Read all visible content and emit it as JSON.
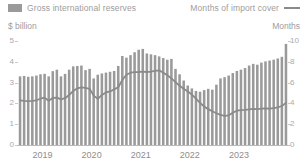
{
  "legend": {
    "bars": {
      "label": "Gross international reserves",
      "icon": "bar-swatch",
      "color": "#9a9a9a"
    },
    "line": {
      "label": "Months of import cover",
      "icon": "line-swatch",
      "color": "#8a8a8a"
    }
  },
  "axes": {
    "left_title": "$ billion",
    "right_title": "Months",
    "left_ticks": [
      "5",
      "4",
      "3",
      "2",
      "1",
      "0"
    ],
    "right_ticks": [
      "10",
      "8",
      "6",
      "4",
      "2",
      "0"
    ]
  },
  "chart_data": {
    "type": "bar",
    "title": "",
    "subtitle": "",
    "xlabel": "",
    "ylabel": "$ billion",
    "y2label": "Months",
    "ylim": [
      0,
      5
    ],
    "y2lim": [
      0,
      10
    ],
    "grid": false,
    "legend_position": "top",
    "x_tick_labels": [
      "2019",
      "2020",
      "2021",
      "2022",
      "2023"
    ],
    "x_tick_index": [
      0,
      12,
      24,
      36,
      48
    ],
    "categories": [
      "2019-01",
      "2019-02",
      "2019-03",
      "2019-04",
      "2019-05",
      "2019-06",
      "2019-07",
      "2019-08",
      "2019-09",
      "2019-10",
      "2019-11",
      "2019-12",
      "2020-01",
      "2020-02",
      "2020-03",
      "2020-04",
      "2020-05",
      "2020-06",
      "2020-07",
      "2020-08",
      "2020-09",
      "2020-10",
      "2020-11",
      "2020-12",
      "2021-01",
      "2021-02",
      "2021-03",
      "2021-04",
      "2021-05",
      "2021-06",
      "2021-07",
      "2021-08",
      "2021-09",
      "2021-10",
      "2021-11",
      "2021-12",
      "2022-01",
      "2022-02",
      "2022-03",
      "2022-04",
      "2022-05",
      "2022-06",
      "2022-07",
      "2022-08",
      "2022-09",
      "2022-10",
      "2022-11",
      "2022-12",
      "2023-01",
      "2023-02",
      "2023-03",
      "2023-04",
      "2023-05",
      "2023-06",
      "2023-07",
      "2023-08",
      "2023-09",
      "2023-10",
      "2023-11",
      "2023-12",
      "2024-01",
      "2024-02",
      "2024-03",
      "2024-04",
      "2024-05",
      "2024-06"
    ],
    "series": [
      {
        "name": "Gross international reserves",
        "type": "bar",
        "axis": "left",
        "unit": "$ billion",
        "color": "#9a9a9a",
        "values": [
          3.3,
          3.32,
          3.28,
          3.3,
          3.34,
          3.4,
          3.42,
          3.3,
          3.55,
          3.62,
          3.3,
          3.42,
          3.62,
          3.78,
          3.8,
          3.82,
          3.6,
          3.66,
          3.2,
          3.38,
          3.44,
          3.48,
          3.52,
          3.56,
          3.8,
          4.28,
          4.2,
          4.32,
          4.46,
          4.58,
          4.62,
          4.4,
          4.36,
          4.32,
          4.26,
          4.18,
          4.1,
          4.14,
          3.66,
          3.4,
          3.1,
          2.86,
          2.72,
          2.6,
          2.56,
          2.64,
          2.7,
          2.66,
          2.9,
          3.2,
          3.26,
          3.34,
          3.46,
          3.56,
          3.62,
          3.7,
          3.82,
          3.9,
          3.86,
          3.96,
          4.02,
          4.06,
          4.1,
          4.16,
          4.24,
          4.86
        ]
      },
      {
        "name": "Months of import cover",
        "type": "line",
        "axis": "right",
        "unit": "Months",
        "color": "#8a8a8a",
        "values": [
          4.3,
          4.25,
          4.22,
          4.25,
          4.3,
          4.45,
          4.55,
          4.25,
          4.52,
          4.55,
          4.38,
          4.5,
          4.8,
          5.2,
          5.45,
          5.55,
          5.5,
          5.4,
          4.75,
          4.45,
          4.8,
          5.05,
          5.15,
          5.35,
          5.55,
          6.25,
          6.75,
          6.95,
          7.0,
          7.02,
          7.05,
          7.02,
          7.05,
          7.12,
          7.18,
          6.95,
          6.72,
          6.4,
          6.05,
          5.7,
          5.4,
          5.15,
          4.85,
          4.45,
          4.05,
          3.7,
          3.45,
          3.25,
          3.05,
          2.9,
          2.8,
          2.85,
          3.1,
          3.3,
          3.35,
          3.38,
          3.42,
          3.48,
          3.45,
          3.5,
          3.52,
          3.5,
          3.55,
          3.62,
          3.75,
          4.05
        ]
      }
    ]
  }
}
